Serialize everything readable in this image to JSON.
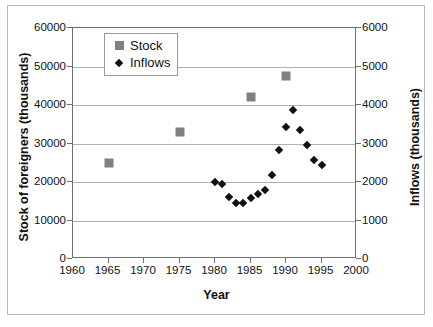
{
  "chart_data": {
    "type": "scatter",
    "title": "",
    "xlabel": "Year",
    "ylabel_left": "Stock of foreigners (thousands)",
    "ylabel_right": "Inflows (thousands)",
    "xlim": [
      1960,
      2000
    ],
    "xticks": [
      1960,
      1965,
      1970,
      1975,
      1980,
      1985,
      1990,
      1995,
      2000
    ],
    "ylim_left": [
      0,
      60000
    ],
    "yticks_left": [
      0,
      10000,
      20000,
      30000,
      40000,
      50000,
      60000
    ],
    "ylim_right": [
      0,
      6000
    ],
    "yticks_right": [
      0,
      1000,
      2000,
      3000,
      4000,
      5000,
      6000
    ],
    "grid": "horizontal",
    "legend_position": "top-left-inside",
    "series": [
      {
        "name": "Stock",
        "axis": "left",
        "marker": "square",
        "color": "#808080",
        "points": [
          {
            "x": 1965,
            "y": 25000
          },
          {
            "x": 1975,
            "y": 33000
          },
          {
            "x": 1985,
            "y": 42000
          },
          {
            "x": 1990,
            "y": 47500
          }
        ]
      },
      {
        "name": "Inflows",
        "axis": "right",
        "marker": "diamond",
        "color": "#111111",
        "points": [
          {
            "x": 1980,
            "y": 2000
          },
          {
            "x": 1981,
            "y": 1960
          },
          {
            "x": 1982,
            "y": 1600
          },
          {
            "x": 1983,
            "y": 1450
          },
          {
            "x": 1984,
            "y": 1450
          },
          {
            "x": 1985,
            "y": 1580
          },
          {
            "x": 1986,
            "y": 1700
          },
          {
            "x": 1987,
            "y": 1800
          },
          {
            "x": 1988,
            "y": 2180
          },
          {
            "x": 1989,
            "y": 2830
          },
          {
            "x": 1990,
            "y": 3430
          },
          {
            "x": 1991,
            "y": 3880
          },
          {
            "x": 1992,
            "y": 3340
          },
          {
            "x": 1993,
            "y": 2960
          },
          {
            "x": 1994,
            "y": 2580
          },
          {
            "x": 1995,
            "y": 2430
          }
        ]
      }
    ]
  },
  "legend": {
    "items": [
      {
        "label": "Stock",
        "marker": "square"
      },
      {
        "label": "Inflows",
        "marker": "diamond"
      }
    ]
  }
}
